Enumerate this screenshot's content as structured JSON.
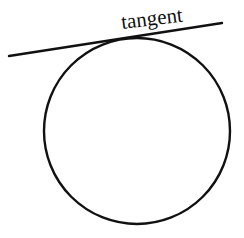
{
  "diagram": {
    "label": "tangent",
    "colors": {
      "stroke": "#111111",
      "background": "#ffffff"
    },
    "circle": {
      "cx": 137,
      "cy": 131,
      "r": 93
    },
    "tangent_line": {
      "x1": 9,
      "y1": 56,
      "x2": 222,
      "y2": 23
    },
    "label_position": {
      "x": 122,
      "y": 29,
      "rotate": -7
    }
  }
}
